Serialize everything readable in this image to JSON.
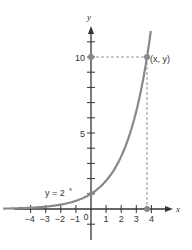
{
  "chart_data": {
    "type": "line",
    "title": "",
    "function_label": "y = 2",
    "function_exponent": "x",
    "xlabel": "x",
    "ylabel": "y",
    "x_ticks": [
      -4,
      -3,
      -2,
      -1,
      1,
      2,
      3,
      4
    ],
    "x_tick_labels": [
      "−4",
      "−3",
      "−2",
      "−1",
      "1",
      "2",
      "3",
      "4"
    ],
    "origin_label": "0",
    "y_ticks": [
      -1,
      1,
      2,
      3,
      4,
      5,
      6,
      7,
      8,
      9,
      10,
      11
    ],
    "y_tick_labels": {
      "5": "5",
      "10": "10"
    },
    "xlim": [
      -5.2,
      5.5
    ],
    "ylim": [
      -2,
      12.5
    ],
    "grid": false,
    "series": [
      {
        "name": "y = 2^x",
        "x": [
          -5.2,
          -4,
          -3,
          -2,
          -1,
          0,
          1,
          2,
          3,
          3.32,
          3.7,
          3.9
        ],
        "y": [
          0.027,
          0.0625,
          0.125,
          0.25,
          0.5,
          1,
          2,
          4,
          8,
          10,
          13,
          14.9
        ]
      }
    ],
    "highlighted_point": {
      "label": "(x, y)",
      "x": 3.32,
      "y": 10
    },
    "annotations": [
      {
        "type": "dashed-horizontal",
        "from": [
          0,
          10
        ],
        "to": [
          3.32,
          10
        ]
      },
      {
        "type": "dashed-vertical",
        "from": [
          3.32,
          10
        ],
        "to": [
          3.32,
          0
        ]
      },
      {
        "type": "point",
        "at": [
          0,
          10
        ]
      },
      {
        "type": "point",
        "at": [
          3.32,
          0
        ]
      },
      {
        "type": "point",
        "at": [
          0,
          1
        ]
      }
    ],
    "colors": {
      "curve": "#888888",
      "axis": "#333333",
      "dashed": "#999999",
      "points": "#888888"
    }
  }
}
